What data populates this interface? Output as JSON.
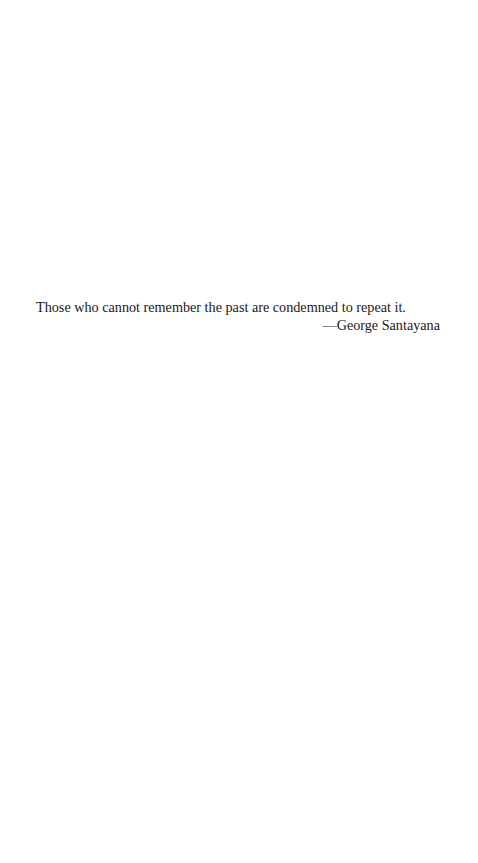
{
  "epigraph": {
    "quote": "Those who cannot remember the past are condemned to repeat it.",
    "attribution": "—George Santayana"
  }
}
